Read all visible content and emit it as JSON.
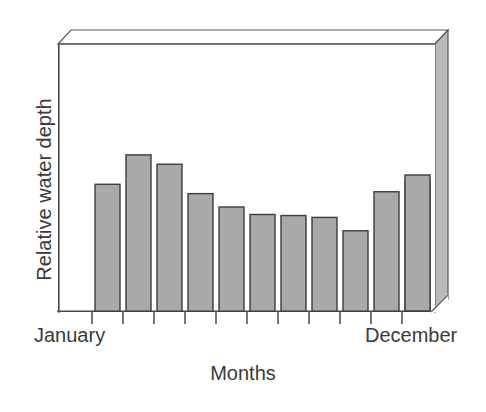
{
  "chart_data": {
    "type": "bar",
    "title": "",
    "subtitle": "",
    "xlabel": "Months",
    "ylabel": "Relative water depth",
    "categories": [
      "January",
      "February",
      "March",
      "April",
      "May",
      "June",
      "July",
      "August",
      "September",
      "October",
      "November",
      "December"
    ],
    "tick_labels_shown": [
      "January",
      "December"
    ],
    "values": [
      48.6,
      47.5,
      58.5,
      55.0,
      44.0,
      39.0,
      36.2,
      35.8,
      35.1,
      30.1,
      44.7,
      48.6
    ],
    "ylim": [
      0,
      100
    ],
    "xlim_note": "12 equally spaced month categories, only first and last labelled",
    "y_tick_labels": [],
    "grid": false,
    "legend": null,
    "legend_position": "none",
    "annotations": [],
    "style": {
      "bar_fill": "#a9a9a9",
      "bar_edge": "#3d3d3d",
      "axis_color": "#4a4a4a",
      "wall_fill": "#b8b8b8",
      "plot_background": "#ffffff",
      "three_d": true
    }
  },
  "axis": {
    "x_title": "Months",
    "y_title": "Relative water depth",
    "first_label": "January",
    "last_label": "December"
  },
  "figure": {
    "background": "#ffffff"
  }
}
